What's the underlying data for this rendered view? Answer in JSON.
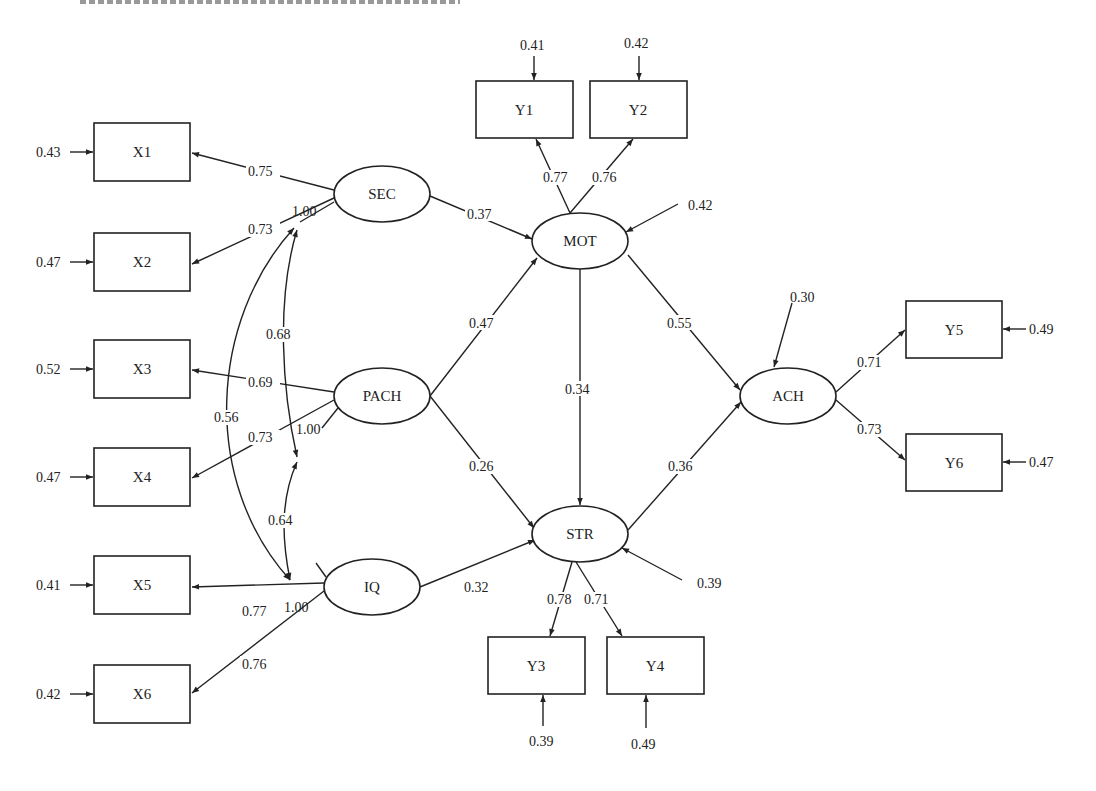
{
  "diagram": {
    "type": "structural-equation-model path diagram",
    "observed": [
      {
        "id": "X1",
        "x": 94,
        "y": 123,
        "w": 96,
        "h": 58,
        "error": "0.43",
        "err_side": "left"
      },
      {
        "id": "X2",
        "x": 94,
        "y": 233,
        "w": 96,
        "h": 58,
        "error": "0.47",
        "err_side": "left"
      },
      {
        "id": "X3",
        "x": 94,
        "y": 340,
        "w": 96,
        "h": 58,
        "error": "0.52",
        "err_side": "left"
      },
      {
        "id": "X4",
        "x": 94,
        "y": 448,
        "w": 96,
        "h": 58,
        "error": "0.47",
        "err_side": "left"
      },
      {
        "id": "X5",
        "x": 94,
        "y": 556,
        "w": 96,
        "h": 58,
        "error": "0.41",
        "err_side": "left"
      },
      {
        "id": "X6",
        "x": 94,
        "y": 665,
        "w": 96,
        "h": 58,
        "error": "0.42",
        "err_side": "left"
      },
      {
        "id": "Y1",
        "x": 476,
        "y": 81,
        "w": 97,
        "h": 57,
        "error": "0.41",
        "err_side": "top"
      },
      {
        "id": "Y2",
        "x": 590,
        "y": 81,
        "w": 97,
        "h": 57,
        "error": "0.42",
        "err_side": "top"
      },
      {
        "id": "Y3",
        "x": 488,
        "y": 637,
        "w": 97,
        "h": 57,
        "error": "0.39",
        "err_side": "bottom"
      },
      {
        "id": "Y4",
        "x": 607,
        "y": 637,
        "w": 97,
        "h": 57,
        "error": "0.49",
        "err_side": "bottom"
      },
      {
        "id": "Y5",
        "x": 906,
        "y": 301,
        "w": 96,
        "h": 57,
        "error": "0.49",
        "err_side": "right"
      },
      {
        "id": "Y6",
        "x": 906,
        "y": 434,
        "w": 96,
        "h": 57,
        "error": "0.47",
        "err_side": "right"
      }
    ],
    "latent": [
      {
        "id": "SEC",
        "cx": 382,
        "cy": 194,
        "rx": 48,
        "ry": 28
      },
      {
        "id": "PACH",
        "cx": 382,
        "cy": 396,
        "rx": 48,
        "ry": 28
      },
      {
        "id": "IQ",
        "cx": 372,
        "cy": 587,
        "rx": 48,
        "ry": 28
      },
      {
        "id": "MOT",
        "cx": 580,
        "cy": 241,
        "rx": 48,
        "ry": 28
      },
      {
        "id": "STR",
        "cx": 580,
        "cy": 534,
        "rx": 48,
        "ry": 28
      },
      {
        "id": "ACH",
        "cx": 788,
        "cy": 396,
        "rx": 48,
        "ry": 28
      }
    ],
    "loadings": [
      {
        "from": "SEC",
        "to": "X1",
        "value": "0.75"
      },
      {
        "from": "SEC",
        "to": "X2",
        "value": "0.73"
      },
      {
        "from": "PACH",
        "to": "X3",
        "value": "0.69"
      },
      {
        "from": "PACH",
        "to": "X4",
        "value": "0.73"
      },
      {
        "from": "IQ",
        "to": "X5",
        "value": "0.77"
      },
      {
        "from": "IQ",
        "to": "X6",
        "value": "0.76"
      },
      {
        "from": "MOT",
        "to": "Y1",
        "value": "0.77"
      },
      {
        "from": "MOT",
        "to": "Y2",
        "value": "0.76"
      },
      {
        "from": "STR",
        "to": "Y3",
        "value": "0.78"
      },
      {
        "from": "STR",
        "to": "Y4",
        "value": "0.71"
      },
      {
        "from": "ACH",
        "to": "Y5",
        "value": "0.71"
      },
      {
        "from": "ACH",
        "to": "Y6",
        "value": "0.73"
      }
    ],
    "paths": [
      {
        "from": "SEC",
        "to": "MOT",
        "value": "0.37"
      },
      {
        "from": "PACH",
        "to": "MOT",
        "value": "0.47"
      },
      {
        "from": "PACH",
        "to": "STR",
        "value": "0.26"
      },
      {
        "from": "IQ",
        "to": "STR",
        "value": "0.32"
      },
      {
        "from": "MOT",
        "to": "STR",
        "value": "0.34"
      },
      {
        "from": "MOT",
        "to": "ACH",
        "value": "0.55"
      },
      {
        "from": "STR",
        "to": "ACH",
        "value": "0.36"
      }
    ],
    "covariances": [
      {
        "a": "SEC",
        "b": "PACH",
        "value": "0.68"
      },
      {
        "a": "PACH",
        "b": "IQ",
        "value": "0.64"
      },
      {
        "a": "SEC",
        "b": "IQ",
        "value": "0.56"
      }
    ],
    "variances": [
      {
        "node": "SEC",
        "value": "1.00"
      },
      {
        "node": "PACH",
        "value": "1.00"
      },
      {
        "node": "IQ",
        "value": "1.00"
      }
    ],
    "disturbances": [
      {
        "node": "MOT",
        "value": "0.42"
      },
      {
        "node": "STR",
        "value": "0.39"
      },
      {
        "node": "ACH",
        "value": "0.30"
      }
    ]
  },
  "labels": {
    "X1": "X1",
    "X2": "X2",
    "X3": "X3",
    "X4": "X4",
    "X5": "X5",
    "X6": "X6",
    "Y1": "Y1",
    "Y2": "Y2",
    "Y3": "Y3",
    "Y4": "Y4",
    "Y5": "Y5",
    "Y6": "Y6",
    "SEC": "SEC",
    "PACH": "PACH",
    "IQ": "IQ",
    "MOT": "MOT",
    "STR": "STR",
    "ACH": "ACH",
    "e_X1": "0.43",
    "e_X2": "0.47",
    "e_X3": "0.52",
    "e_X4": "0.47",
    "e_X5": "0.41",
    "e_X6": "0.42",
    "e_Y1": "0.41",
    "e_Y2": "0.42",
    "e_Y3": "0.39",
    "e_Y4": "0.49",
    "e_Y5": "0.49",
    "e_Y6": "0.47",
    "l_SEC_X1": "0.75",
    "l_SEC_X2": "0.73",
    "l_PACH_X3": "0.69",
    "l_PACH_X4": "0.73",
    "l_IQ_X5": "0.77",
    "l_IQ_X6": "0.76",
    "l_MOT_Y1": "0.77",
    "l_MOT_Y2": "0.76",
    "l_STR_Y3": "0.78",
    "l_STR_Y4": "0.71",
    "l_ACH_Y5": "0.71",
    "l_ACH_Y6": "0.73",
    "p_SEC_MOT": "0.37",
    "p_PACH_MOT": "0.47",
    "p_PACH_STR": "0.26",
    "p_IQ_STR": "0.32",
    "p_MOT_STR": "0.34",
    "p_MOT_ACH": "0.55",
    "p_STR_ACH": "0.36",
    "c_SEC_PACH": "0.68",
    "c_PACH_IQ": "0.64",
    "c_SEC_IQ": "0.56",
    "v_SEC": "1.00",
    "v_PACH": "1.00",
    "v_IQ": "1.00",
    "d_MOT": "0.42",
    "d_STR": "0.39",
    "d_ACH": "0.30"
  }
}
